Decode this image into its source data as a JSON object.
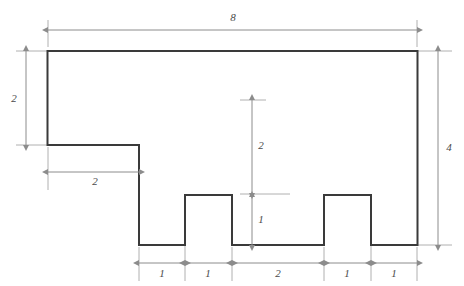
{
  "diagram": {
    "type": "geometry-dimension-diagram",
    "background_color": "#ffffff",
    "outline_color": "#3a3a3a",
    "dimension_color": "#8c8c8c",
    "label_color": "#4a4a4a",
    "outline_width": 2,
    "dimension_width": 1,
    "units": "units",
    "shape": {
      "name": "rectilinear-polygon",
      "description": "8 by 4 rectangle with a 2 by 2 notch removed from the upper-left corner and a 2 wide by 2 tall U-notch removed from the bottom center, leaving two legs of width 1 with 1-tall feet",
      "grid_scale_px": 46.2,
      "origin_px": {
        "x": 47.5,
        "y": 51.0
      },
      "vertices_units": [
        [
          0,
          0
        ],
        [
          8,
          0
        ],
        [
          8,
          4
        ],
        [
          6.5,
          4
        ],
        [
          6.5,
          3
        ],
        [
          5.5,
          3
        ],
        [
          5.5,
          4
        ],
        [
          3.5,
          4
        ],
        [
          3.5,
          3
        ],
        [
          2.5,
          3
        ],
        [
          2.5,
          4
        ],
        [
          2,
          4
        ],
        [
          2,
          2
        ],
        [
          0,
          2
        ]
      ],
      "vertices_px": [
        [
          47.5,
          51
        ],
        [
          417.5,
          51
        ],
        [
          417.5,
          245
        ],
        [
          371,
          245
        ],
        [
          371,
          195
        ],
        [
          324,
          195
        ],
        [
          324,
          245
        ],
        [
          232,
          245
        ],
        [
          232,
          195
        ],
        [
          185,
          195
        ],
        [
          185,
          245
        ],
        [
          139,
          245
        ],
        [
          139,
          145
        ],
        [
          47.5,
          145
        ]
      ]
    },
    "dimensions": [
      {
        "id": "top-width",
        "label": "8",
        "orientation": "horizontal",
        "value": 8,
        "line_px": {
          "x1": 48,
          "y1": 30,
          "x2": 417,
          "y2": 30
        },
        "label_px": {
          "x": 233,
          "y": 18
        },
        "extension_from_px": {
          "x1": 48,
          "y1": 20,
          "x2": 48,
          "y2": 48
        },
        "extension_to_px": {
          "x1": 417,
          "y1": 20,
          "x2": 417,
          "y2": 48
        }
      },
      {
        "id": "left-height",
        "label": "2",
        "orientation": "vertical",
        "value": 2,
        "line_px": {
          "x1": 26,
          "y1": 51,
          "x2": 26,
          "y2": 145
        },
        "label_px": {
          "x": 14,
          "y": 99
        }
      },
      {
        "id": "left-notch-width",
        "label": "2",
        "orientation": "horizontal",
        "value": 2,
        "line_px": {
          "x1": 48,
          "y1": 172,
          "x2": 139,
          "y2": 172
        },
        "label_px": {
          "x": 95,
          "y": 182
        }
      },
      {
        "id": "right-height",
        "label": "4",
        "orientation": "vertical",
        "value": 4,
        "line_px": {
          "x1": 438,
          "y1": 51,
          "x2": 438,
          "y2": 245
        },
        "label_px": {
          "x": 449,
          "y": 148
        }
      },
      {
        "id": "inner-notch-height-upper",
        "label": "2",
        "orientation": "vertical",
        "value": 2,
        "line_px": {
          "x1": 252,
          "y1": 100,
          "x2": 252,
          "y2": 193
        },
        "label_px": {
          "x": 261,
          "y": 146
        }
      },
      {
        "id": "inner-notch-height-lower",
        "label": "1",
        "orientation": "vertical",
        "value": 1,
        "line_px": {
          "x1": 252,
          "y1": 196,
          "x2": 252,
          "y2": 245
        },
        "label_px": {
          "x": 261,
          "y": 220
        }
      }
    ],
    "bottom_chain": {
      "id": "bottom-dimension-chain",
      "line_y_px": 263,
      "ticks_px": [
        139,
        185,
        232,
        324,
        371,
        417
      ],
      "segments": [
        {
          "label": "1",
          "value": 1,
          "x1": 139,
          "x2": 185,
          "label_x": 162
        },
        {
          "label": "1",
          "value": 1,
          "x1": 185,
          "x2": 232,
          "label_x": 208
        },
        {
          "label": "2",
          "value": 2,
          "x1": 232,
          "x2": 324,
          "label_x": 278
        },
        {
          "label": "1",
          "value": 1,
          "x1": 324,
          "x2": 371,
          "label_x": 347
        },
        {
          "label": "1",
          "value": 1,
          "x1": 371,
          "x2": 417,
          "label_x": 394
        }
      ],
      "label_y_px": 274
    }
  }
}
